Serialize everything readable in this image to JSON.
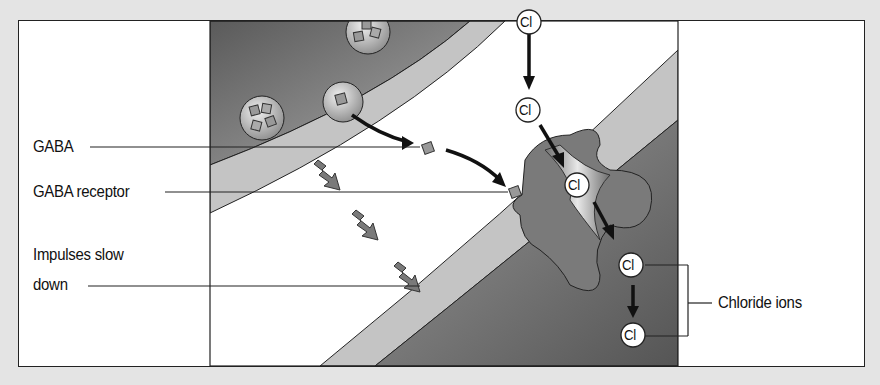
{
  "diagram": {
    "labels": {
      "gaba": "GABA",
      "gaba_receptor": "GABA receptor",
      "impulses_line1": "Impulses slow",
      "impulses_line2": "down",
      "chloride_ions": "Chloride ions"
    },
    "ions": [
      {
        "symbol": "Cl",
        "x": 527,
        "y": 17
      },
      {
        "symbol": "Cl",
        "x": 528,
        "y": 110
      },
      {
        "symbol": "Cl",
        "x": 577,
        "y": 185
      },
      {
        "symbol": "Cl",
        "x": 630,
        "y": 268
      },
      {
        "symbol": "Cl",
        "x": 632,
        "y": 333
      }
    ],
    "colors": {
      "background": "#e4e4e4",
      "panel": "#ffffff",
      "dark_cell": "#6a6a6a",
      "membrane": "#bdbdbd",
      "receptor": "#7d7d7d",
      "outline": "#222222"
    }
  }
}
